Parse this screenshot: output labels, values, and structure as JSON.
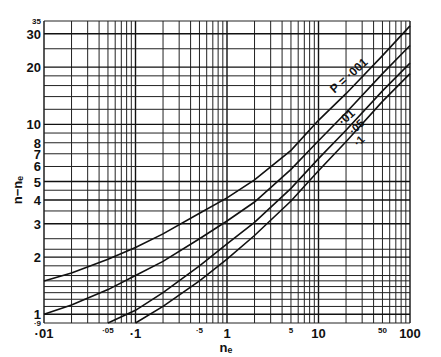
{
  "chart_data": {
    "type": "line",
    "title": "",
    "xlabel": "nₑ",
    "ylabel": "n−nₑ",
    "xscale": "log",
    "yscale": "log",
    "xlim": [
      0.01,
      100
    ],
    "ylim": [
      0.9,
      35
    ],
    "grid": true,
    "x_ticks": [
      {
        "value": 0.01,
        "label": "·01",
        "size": "large"
      },
      {
        "value": 0.05,
        "label": "·05",
        "size": "small"
      },
      {
        "value": 0.1,
        "label": "·1",
        "size": "large"
      },
      {
        "value": 0.5,
        "label": "·5",
        "size": "small"
      },
      {
        "value": 1,
        "label": "1",
        "size": "large"
      },
      {
        "value": 5,
        "label": "5",
        "size": "small"
      },
      {
        "value": 10,
        "label": "10",
        "size": "large"
      },
      {
        "value": 50,
        "label": "50",
        "size": "small"
      },
      {
        "value": 100,
        "label": "100",
        "size": "large"
      }
    ],
    "y_ticks": [
      {
        "value": 0.9,
        "label": "·9",
        "size": "small"
      },
      {
        "value": 1,
        "label": "1",
        "size": "large"
      },
      {
        "value": 2,
        "label": "2",
        "size": "large"
      },
      {
        "value": 3,
        "label": "3",
        "size": "large"
      },
      {
        "value": 4,
        "label": "4",
        "size": "large"
      },
      {
        "value": 5,
        "label": "5",
        "size": "large"
      },
      {
        "value": 6,
        "label": "6",
        "size": "large"
      },
      {
        "value": 7,
        "label": "7",
        "size": "large"
      },
      {
        "value": 8,
        "label": "8",
        "size": "large"
      },
      {
        "value": 10,
        "label": "10",
        "size": "large"
      },
      {
        "value": 20,
        "label": "20",
        "size": "large"
      },
      {
        "value": 30,
        "label": "30",
        "size": "large"
      },
      {
        "value": 35,
        "label": "35",
        "size": "small"
      }
    ],
    "series": [
      {
        "name": "P = ·001",
        "label": "P = ·001",
        "x": [
          0.01,
          0.02,
          0.05,
          0.1,
          0.2,
          0.5,
          1,
          2,
          5,
          10,
          20,
          50,
          100
        ],
        "y": [
          1.5,
          1.65,
          1.95,
          2.25,
          2.65,
          3.4,
          4.1,
          5.1,
          7.3,
          10.5,
          14.5,
          23,
          33
        ]
      },
      {
        "name": "P = ·01",
        "label": "·01",
        "x": [
          0.01,
          0.02,
          0.05,
          0.1,
          0.2,
          0.5,
          1,
          2,
          5,
          10,
          20,
          50,
          100
        ],
        "y": [
          1.0,
          1.12,
          1.35,
          1.6,
          1.9,
          2.5,
          3.1,
          3.9,
          5.8,
          8.2,
          11.5,
          18.5,
          26
        ]
      },
      {
        "name": "P = ·05",
        "label": "·05",
        "x": [
          0.05,
          0.1,
          0.2,
          0.5,
          1,
          2,
          5,
          10,
          20,
          50,
          100
        ],
        "y": [
          0.9,
          1.05,
          1.3,
          1.8,
          2.35,
          3.05,
          4.6,
          6.6,
          9.3,
          15,
          21
        ]
      },
      {
        "name": "P = ·1",
        "label": "·1",
        "x": [
          0.1,
          0.2,
          0.5,
          1,
          2,
          5,
          10,
          20,
          50,
          100
        ],
        "y": [
          0.9,
          1.1,
          1.5,
          1.95,
          2.6,
          3.95,
          5.7,
          8.1,
          13.2,
          18.5
        ]
      }
    ]
  }
}
